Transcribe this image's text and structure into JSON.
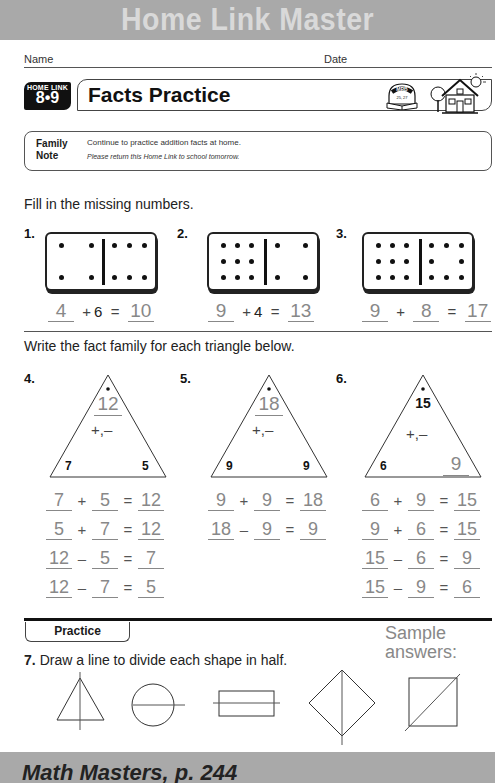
{
  "header": {
    "banner_title": "Home Link Master",
    "name_label": "Name",
    "date_label": "Date"
  },
  "lesson": {
    "badge_top": "HOME LINK",
    "badge_number": "8•9",
    "title": "Facts Practice",
    "mrb_label": "MRB",
    "mrb_pages": "25, 27"
  },
  "family_note": {
    "label_line1": "Family",
    "label_line2": "Note",
    "line1": "Continue to practice addition facts at home.",
    "line2": "Please return this Home Link to school tomorrow."
  },
  "section1": {
    "instruction": "Fill in the missing numbers.",
    "problems": [
      {
        "number": "1.",
        "left_dots": 4,
        "right_dots": 6,
        "answer_a": "4",
        "op": "+",
        "given_b": "6",
        "eq": "=",
        "answer_sum": "10"
      },
      {
        "number": "2.",
        "left_dots": 9,
        "right_dots": 4,
        "answer_a": "9",
        "op": "+",
        "given_b": "4",
        "eq": "=",
        "answer_sum": "13"
      },
      {
        "number": "3.",
        "left_dots": 9,
        "right_dots": 8,
        "answer_a": "9",
        "op": "+",
        "answer_b": "8",
        "eq": "=",
        "answer_sum": "17"
      }
    ]
  },
  "section2": {
    "instruction": "Write the fact family for each triangle below.",
    "problems": [
      {
        "number": "4.",
        "top": "12",
        "ops": "+,–",
        "left": "7",
        "right": "5",
        "facts": [
          [
            "7",
            "+",
            "5",
            "=",
            "12"
          ],
          [
            "5",
            "+",
            "7",
            "=",
            "12"
          ],
          [
            "12",
            "–",
            "5",
            "=",
            "7"
          ],
          [
            "12",
            "–",
            "7",
            "=",
            "5"
          ]
        ]
      },
      {
        "number": "5.",
        "top": "18",
        "ops": "+,–",
        "left": "9",
        "right": "9",
        "facts": [
          [
            "9",
            "+",
            "9",
            "=",
            "18"
          ],
          [
            "18",
            "–",
            "9",
            "=",
            "9"
          ]
        ]
      },
      {
        "number": "6.",
        "top": "15",
        "ops": "+,–",
        "left": "6",
        "right": "9",
        "facts": [
          [
            "6",
            "+",
            "9",
            "=",
            "15"
          ],
          [
            "9",
            "+",
            "6",
            "=",
            "15"
          ],
          [
            "15",
            "–",
            "6",
            "=",
            "9"
          ],
          [
            "15",
            "–",
            "9",
            "=",
            "6"
          ]
        ]
      }
    ]
  },
  "practice": {
    "tab_label": "Practice",
    "sample_line1": "Sample",
    "sample_line2": "answers:",
    "q_number": "7.",
    "q_text": "Draw a line to divide each shape in half.",
    "shapes": [
      "triangle",
      "circle",
      "rectangle",
      "diamond",
      "square"
    ]
  },
  "footer": {
    "text": "Math Masters, p. 244"
  },
  "colors": {
    "banner": "#a9a9a9",
    "banner_text": "#d9d9d9",
    "answer_gray": "#888888",
    "ink": "#111111"
  }
}
